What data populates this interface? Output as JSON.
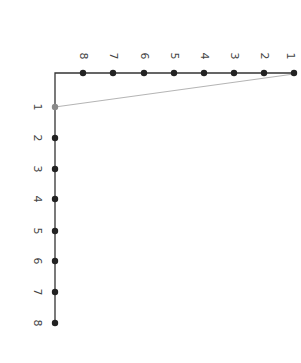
{
  "diagram": {
    "colors": {
      "axis": "#333333",
      "dot": "#222222",
      "connector": "#b0b0b0",
      "highlight_dot": "#888888"
    },
    "top_row": {
      "labels": [
        "1",
        "2",
        "3",
        "4",
        "5",
        "6",
        "7",
        "8"
      ]
    },
    "side_column": {
      "labels": [
        "1",
        "2",
        "3",
        "4",
        "5",
        "6",
        "7",
        "8"
      ]
    },
    "connector": {
      "from": "top_row.1",
      "to": "side_column.1"
    }
  }
}
